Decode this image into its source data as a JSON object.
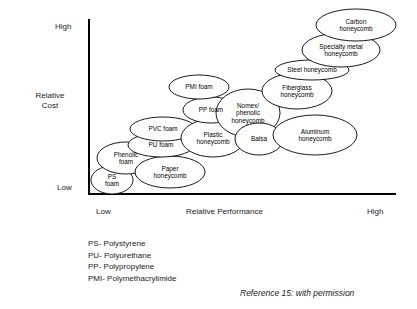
{
  "figure": {
    "title_implicit": "Relative Cost vs Relative Performance of core materials",
    "reference": "Reference 15: with permission"
  },
  "axes": {
    "y_label": "Relative\nCost",
    "y_high": "High",
    "y_low": "Low",
    "x_label": "Relative Performance",
    "x_low": "Low",
    "x_high": "High"
  },
  "legend": {
    "items": [
      "PS- Polystyrene",
      "PU- Polyurethane",
      "PP- Polypropylene",
      "PMI- Polymethacrylimide"
    ]
  },
  "chart_data": {
    "type": "scatter",
    "title": "",
    "xlabel": "Relative Performance",
    "ylabel": "Relative Cost",
    "xlim": [
      "Low",
      "High"
    ],
    "ylim": [
      "Low",
      "High"
    ],
    "grid": false,
    "legend_position": "below-axis",
    "annotations": [
      "PS- Polystyrene",
      "PU- Polyurethane",
      "PP- Polypropylene",
      "PMI- Polymethacrylimide"
    ],
    "note": "Each data point is an outlined ellipse (bubble) labelled with a core material name; position encodes qualitative relative performance (x) and relative cost (y).",
    "points": [
      {
        "label": "PS\nfoam",
        "cx": 112,
        "cy": 180,
        "rx": 21,
        "ry": 14,
        "performance": 0.08,
        "cost": 0.08
      },
      {
        "label": "Phenolic\nfoam",
        "cx": 126,
        "cy": 158,
        "rx": 29,
        "ry": 16,
        "performance": 0.13,
        "cost": 0.21
      },
      {
        "label": "Paper\nhoneycomb",
        "cx": 170,
        "cy": 172,
        "rx": 35,
        "ry": 16,
        "performance": 0.27,
        "cost": 0.13
      },
      {
        "label": "PU foam",
        "cx": 161,
        "cy": 145,
        "rx": 33,
        "ry": 12,
        "performance": 0.24,
        "cost": 0.29
      },
      {
        "label": "PVC foam",
        "cx": 163,
        "cy": 129,
        "rx": 33,
        "ry": 12,
        "performance": 0.25,
        "cost": 0.38
      },
      {
        "label": "Plastic\nhoneycomb",
        "cx": 213,
        "cy": 138,
        "rx": 32,
        "ry": 19,
        "performance": 0.39,
        "cost": 0.33
      },
      {
        "label": "PP foam",
        "cx": 211,
        "cy": 110,
        "rx": 28,
        "ry": 13,
        "performance": 0.38,
        "cost": 0.49
      },
      {
        "label": "PMI foam",
        "cx": 199,
        "cy": 87,
        "rx": 30,
        "ry": 12,
        "performance": 0.35,
        "cost": 0.62
      },
      {
        "label": "Nomex/\nphenolic\nhoneycomb",
        "cx": 248,
        "cy": 113,
        "rx": 32,
        "ry": 24,
        "performance": 0.51,
        "cost": 0.47
      },
      {
        "label": "Balsa",
        "cx": 259,
        "cy": 139,
        "rx": 24,
        "ry": 16,
        "performance": 0.55,
        "cost": 0.32
      },
      {
        "label": "Aluminum\nhoneycomb",
        "cx": 315,
        "cy": 135,
        "rx": 42,
        "ry": 20,
        "performance": 0.71,
        "cost": 0.34
      },
      {
        "label": "Fiberglass\nhoneycomb",
        "cx": 297,
        "cy": 91,
        "rx": 35,
        "ry": 18,
        "performance": 0.66,
        "cost": 0.59
      },
      {
        "label": "Steel honeycomb",
        "cx": 312,
        "cy": 70,
        "rx": 37,
        "ry": 10,
        "performance": 0.7,
        "cost": 0.71
      },
      {
        "label": "Specialty metal\nhoneycomb",
        "cx": 341,
        "cy": 50,
        "rx": 39,
        "ry": 17,
        "performance": 0.8,
        "cost": 0.82
      },
      {
        "label": "Carbon\nhoneycomb",
        "cx": 356,
        "cy": 25,
        "rx": 40,
        "ry": 16,
        "performance": 0.85,
        "cost": 0.95
      }
    ]
  }
}
